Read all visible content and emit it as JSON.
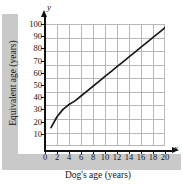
{
  "chart_data": {
    "type": "line",
    "title": "",
    "xlabel": "Dog's age (years)",
    "ylabel": "Equivalent age (years)",
    "x_axis_variable": "x",
    "y_axis_variable": "y",
    "xlim": [
      0,
      20
    ],
    "ylim": [
      0,
      100
    ],
    "grid": true,
    "legend": null,
    "x_ticks": [
      0,
      2,
      4,
      6,
      8,
      10,
      12,
      14,
      16,
      18,
      20
    ],
    "y_ticks": [
      10,
      20,
      30,
      40,
      50,
      60,
      70,
      80,
      90,
      100
    ],
    "series": [
      {
        "name": "Dog age to equivalent human age",
        "color": "#1a1a1a",
        "x": [
          1,
          2,
          3,
          4,
          5,
          6,
          7,
          8,
          9,
          10,
          11,
          12,
          13,
          14,
          15,
          16,
          17,
          18,
          19,
          20
        ],
        "values": [
          15,
          24,
          30,
          34,
          37,
          41,
          45,
          49,
          53,
          57,
          61,
          65,
          69,
          73,
          77,
          81,
          85,
          89,
          93,
          97
        ]
      }
    ]
  },
  "axes": {
    "y_tick_labels": [
      "100",
      "90",
      "80",
      "70",
      "60",
      "50",
      "40",
      "30",
      "20",
      "10"
    ],
    "x_tick_labels": [
      "0",
      "2",
      "4",
      "6",
      "8",
      "10",
      "12",
      "14",
      "16",
      "18",
      "20"
    ],
    "x_title": "Dog's age (years)",
    "y_title": "Equivalent age (years)",
    "x_variable": "x",
    "y_variable": "y"
  },
  "colors": {
    "curve": "#1a1a1a",
    "grid": "#b8b8b8",
    "axis": "#111111",
    "band": "#c9c9c9",
    "background": "#ffffff"
  }
}
